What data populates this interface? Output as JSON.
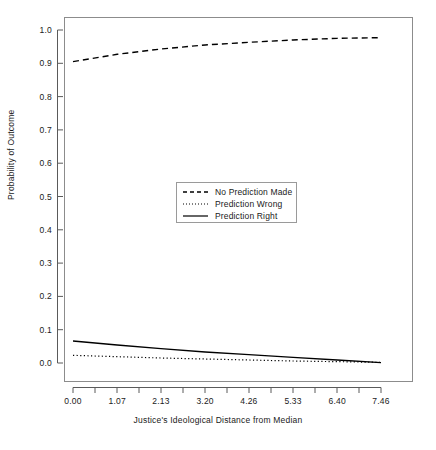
{
  "chart_data": {
    "type": "line",
    "title": "",
    "xlabel": "Justice's Ideological Distance from Median",
    "ylabel": "Probability of Outcome",
    "xlim": [
      0.0,
      7.46
    ],
    "ylim": [
      0.0,
      1.0
    ],
    "grid": false,
    "legend_position": "center",
    "x_tick_labels": [
      "0.00",
      "1.07",
      "2.13",
      "3.20",
      "4.26",
      "5.33",
      "6.40",
      "7.46"
    ],
    "x_tick_values": [
      0.0,
      1.07,
      2.13,
      3.2,
      4.26,
      5.33,
      6.4,
      7.46
    ],
    "y_tick_labels": [
      "0.0",
      "0.1",
      "0.2",
      "0.3",
      "0.4",
      "0.5",
      "0.6",
      "0.7",
      "0.8",
      "0.9",
      "1.0"
    ],
    "y_tick_values": [
      0.0,
      0.1,
      0.2,
      0.3,
      0.4,
      0.5,
      0.6,
      0.7,
      0.8,
      0.9,
      1.0
    ],
    "x": [
      0.0,
      1.07,
      2.13,
      3.2,
      4.26,
      5.33,
      6.4,
      7.46
    ],
    "series": [
      {
        "name": "No Prediction Made",
        "style": "dashed",
        "color": "#000000",
        "values": [
          0.905,
          0.927,
          0.943,
          0.955,
          0.963,
          0.97,
          0.975,
          0.977
        ]
      },
      {
        "name": "Prediction Wrong",
        "style": "dotted",
        "color": "#000000",
        "values": [
          0.023,
          0.019,
          0.015,
          0.012,
          0.009,
          0.006,
          0.004,
          0.002
        ]
      },
      {
        "name": "Prediction Right",
        "style": "solid",
        "color": "#000000",
        "values": [
          0.066,
          0.054,
          0.043,
          0.033,
          0.025,
          0.017,
          0.009,
          0.001
        ]
      }
    ]
  },
  "legend": {
    "items": [
      {
        "label": "No Prediction Made",
        "style": "dashed"
      },
      {
        "label": "Prediction Wrong",
        "style": "dotted"
      },
      {
        "label": "Prediction Right",
        "style": "solid"
      }
    ]
  }
}
